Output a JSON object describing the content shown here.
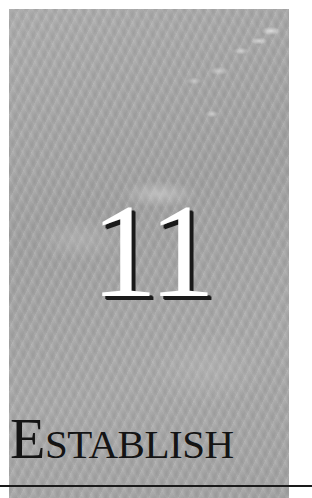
{
  "chapter": {
    "number": "11",
    "title_initial": "E",
    "title_rest": "STABLISH",
    "title_full": "ESTABLISH"
  },
  "colors": {
    "panel_gray": "#a9a9a9",
    "number_fill": "#ffffff",
    "number_shadow": "#1a1a1a",
    "title_text": "#141414",
    "rule": "#1a1a1a",
    "page_background": "#ffffff"
  }
}
